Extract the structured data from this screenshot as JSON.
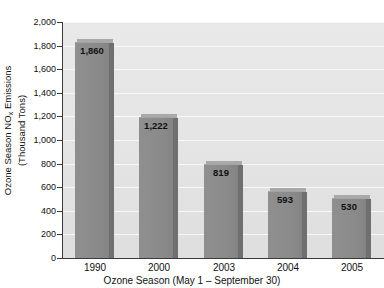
{
  "chart_data": {
    "type": "bar",
    "title": "",
    "categories": [
      "1990",
      "2000",
      "2003",
      "2004",
      "2005"
    ],
    "values": [
      1860,
      1222,
      819,
      593,
      530
    ],
    "value_labels": [
      "1,860",
      "1,222",
      "819",
      "593",
      "530"
    ],
    "xlabel": "Ozone Season (May 1 – September 30)",
    "ylabel": "Ozone Season NOx Emissions (Thousand Tons)",
    "ylabel_line1_prefix": "Ozone Season NO",
    "ylabel_line1_subscript": "x",
    "ylabel_line1_suffix": " Emissions",
    "ylabel_line2": "(Thousand Tons)",
    "ylim": [
      0,
      2000
    ],
    "ytick_values": [
      0,
      200,
      400,
      600,
      800,
      1000,
      1200,
      1400,
      1600,
      1800,
      2000
    ],
    "ytick_labels": [
      "0",
      "200",
      "400",
      "600",
      "800",
      "1,000",
      "1,200",
      "1,400",
      "1,600",
      "1,800",
      "2,000"
    ],
    "grid": true,
    "grid_axis": "y",
    "legend": false,
    "bar_style": "3d-shaded",
    "colors": {
      "bar_face": "#8a8a8a",
      "bar_side": "#6f6f6f",
      "bar_top": "#a9a9a9",
      "plot_background": "#e4e4e4",
      "gridline": "#f7f7f7",
      "axis": "#3a3a3a",
      "text": "#111111",
      "page_background": "#ffffff"
    }
  },
  "clipped_title_fragment": "........"
}
